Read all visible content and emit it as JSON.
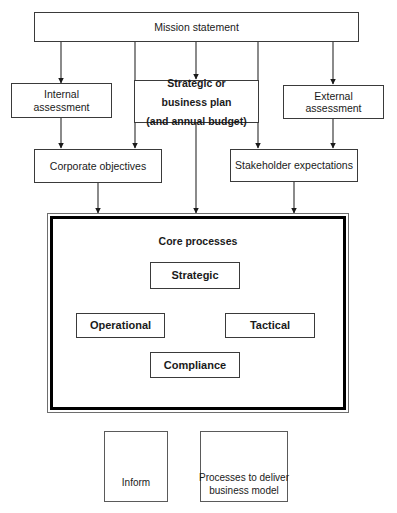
{
  "diagram": {
    "nodes": {
      "mission": "Mission statement",
      "internal_assessment": "Internal assessment",
      "strategic_plan_line1": "Strategic or",
      "strategic_plan_line2": "business plan",
      "strategic_plan_line3": "(and annual budget)",
      "external_assessment": "External assessment",
      "corporate_objectives": "Corporate objectives",
      "stakeholder_expectations": "Stakeholder expectations",
      "core_processes_title": "Core processes",
      "strategic": "Strategic",
      "operational": "Operational",
      "tactical": "Tactical",
      "compliance": "Compliance"
    },
    "legend": {
      "inform_label": "Inform",
      "processes_line1": "Processes to deliver",
      "processes_line2": "business model"
    },
    "colors": {
      "stroke": "#3a3a3a",
      "heavy_stroke": "#000000",
      "background": "#ffffff",
      "text": "#1a1a1a"
    }
  }
}
